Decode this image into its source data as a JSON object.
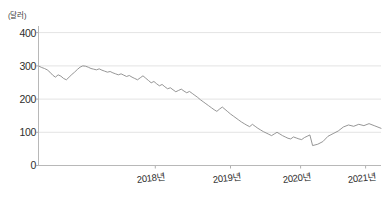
{
  "chart_data": {
    "type": "line",
    "title": "",
    "subtitle": "",
    "xlabel": "",
    "ylabel": "",
    "unit_label": "(달러)",
    "grid": true,
    "legend": "none",
    "ylim": [
      0,
      420
    ],
    "yticks": [
      0,
      100,
      200,
      300,
      400
    ],
    "ytick_labels": [
      "0",
      "100",
      "200",
      "300",
      "400"
    ],
    "xtick_labels": [
      "2018년",
      "2019년",
      "2020년",
      "2021년"
    ],
    "xtick_positions": [
      0.34,
      0.56,
      0.765,
      0.955
    ],
    "xlim_description": "2017 말 ~ 2021 말",
    "series": [
      {
        "name": "주가",
        "color": "#8a8a8a",
        "x": [
          0.0,
          0.008,
          0.016,
          0.024,
          0.032,
          0.04,
          0.048,
          0.056,
          0.064,
          0.072,
          0.08,
          0.088,
          0.096,
          0.104,
          0.112,
          0.12,
          0.128,
          0.136,
          0.144,
          0.152,
          0.16,
          0.168,
          0.176,
          0.184,
          0.192,
          0.2,
          0.208,
          0.216,
          0.224,
          0.232,
          0.24,
          0.248,
          0.256,
          0.264,
          0.272,
          0.28,
          0.288,
          0.296,
          0.304,
          0.312,
          0.32,
          0.328,
          0.336,
          0.344,
          0.352,
          0.36,
          0.368,
          0.376,
          0.384,
          0.392,
          0.4,
          0.408,
          0.416,
          0.424,
          0.432,
          0.44,
          0.448,
          0.456,
          0.464,
          0.472,
          0.48,
          0.488,
          0.496,
          0.504,
          0.512,
          0.52,
          0.528,
          0.536,
          0.544,
          0.552,
          0.56,
          0.568,
          0.576,
          0.584,
          0.592,
          0.6,
          0.608,
          0.616,
          0.624,
          0.632,
          0.64,
          0.648,
          0.656,
          0.664,
          0.672,
          0.68,
          0.688,
          0.696,
          0.704,
          0.712,
          0.72,
          0.728,
          0.736,
          0.744,
          0.752,
          0.76,
          0.768,
          0.776,
          0.784,
          0.792,
          0.8,
          0.808,
          0.816,
          0.824,
          0.832,
          0.84,
          0.848,
          0.856,
          0.864,
          0.872,
          0.88,
          0.888,
          0.896,
          0.904,
          0.912,
          0.92,
          0.928,
          0.936,
          0.944,
          0.952,
          0.96,
          0.968,
          0.976,
          0.984,
          0.992,
          1.0
        ],
        "values": [
          299,
          295,
          292,
          288,
          281,
          272,
          266,
          273,
          269,
          262,
          258,
          266,
          274,
          281,
          289,
          296,
          300,
          299,
          296,
          292,
          290,
          288,
          291,
          287,
          284,
          281,
          283,
          279,
          276,
          273,
          276,
          272,
          268,
          271,
          266,
          262,
          258,
          264,
          270,
          263,
          256,
          249,
          253,
          246,
          240,
          244,
          237,
          231,
          234,
          228,
          222,
          226,
          230,
          224,
          219,
          223,
          217,
          211,
          205,
          198,
          192,
          186,
          180,
          174,
          168,
          163,
          170,
          176,
          169,
          162,
          155,
          149,
          143,
          137,
          131,
          126,
          121,
          117,
          124,
          118,
          112,
          107,
          102,
          98,
          94,
          90,
          95,
          100,
          95,
          90,
          86,
          82,
          80,
          86,
          83,
          80,
          78,
          84,
          88,
          92,
          96,
          90,
          86,
          92,
          88,
          84,
          80,
          86,
          92,
          98,
          104,
          100,
          96,
          102,
          108,
          98,
          64,
          70,
          62,
          58,
          66,
          62,
          70,
          66,
          72,
          68
        ]
      }
    ],
    "series_tail": {
      "name": "주가(2021 회복 구간)",
      "x": [
        0.8,
        0.815,
        0.83,
        0.845,
        0.86,
        0.875,
        0.89,
        0.905,
        0.92,
        0.935,
        0.95,
        0.965,
        0.98,
        1.0
      ],
      "values": [
        60,
        64,
        72,
        88,
        96,
        104,
        116,
        122,
        118,
        124,
        120,
        126,
        120,
        112
      ]
    }
  }
}
